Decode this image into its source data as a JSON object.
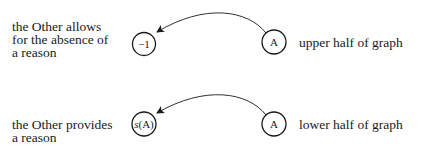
{
  "diagram": {
    "upper": {
      "left_label": "the Other allows\nfor the absence of\na reason",
      "target_node": "−1",
      "source_node": "A",
      "right_label": "upper half of graph"
    },
    "lower": {
      "left_label": "the Other provides\na reason",
      "target_node_prefix": "s",
      "target_node_suffix": "(A)",
      "source_node": "A",
      "right_label": "lower half of graph"
    },
    "colors": {
      "ink": "#1a1a1a",
      "background": "#ffffff"
    }
  }
}
